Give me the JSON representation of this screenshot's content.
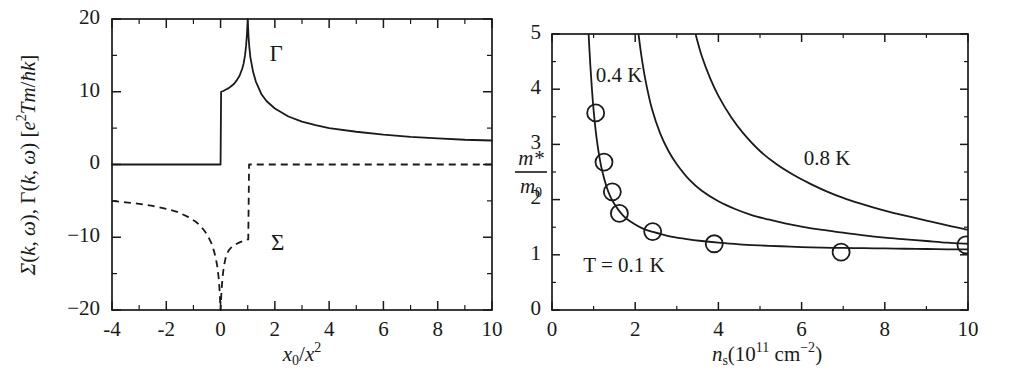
{
  "figure": {
    "panels": [
      {
        "id": "left",
        "name": "self-energy-vertex-plot",
        "xlabel": "x0/x^2",
        "xlabel_parts": {
          "base": "x",
          "sub": "0",
          "slash": "/",
          "base2": "x",
          "sup": "2"
        },
        "ylabel": "Σ(k, ω), Γ(k, ω) [e²Tm/ħk]",
        "ylabel_parts": {
          "sigma": "Σ(k, ω), ",
          "gamma": "Γ(k, ω) [",
          "e": "e",
          "e_sup": "2",
          "unit_rest": "Tm/ħk]"
        },
        "xticks": [
          -4,
          -2,
          0,
          2,
          4,
          6,
          8,
          10
        ],
        "xticklabels": [
          "-4",
          "-2",
          "0",
          "2",
          "4",
          "6",
          "8",
          "10"
        ],
        "xminor": [
          -3,
          -1,
          1,
          3,
          5,
          7,
          9
        ],
        "yticks": [
          -20,
          -10,
          0,
          10,
          20
        ],
        "yticklabels": [
          "-20",
          "-10",
          "0",
          "10",
          "20"
        ],
        "yminor": [
          -15,
          -5,
          5,
          15
        ],
        "xlim": [
          -4,
          10
        ],
        "ylim": [
          -20,
          20
        ],
        "curve_labels": [
          {
            "text": "Γ",
            "x": 2.05,
            "y": 15.0,
            "name": "gamma-curve-label"
          },
          {
            "text": "Σ",
            "x": 2.1,
            "y": -11.0,
            "name": "sigma-curve-label"
          }
        ]
      },
      {
        "id": "right",
        "name": "effective-mass-plot",
        "xlabel": "ns(10^11 cm^-2)",
        "xlabel_parts": {
          "n": "n",
          "n_sub": "s",
          "open": "(10",
          "exp": "11",
          "unit": " cm",
          "unit_exp": "–2",
          "close": ")"
        },
        "ylabel": "m*/m0",
        "ylabel_parts": {
          "num": "m*",
          "den_base": "m",
          "den_sub": "0"
        },
        "xticks": [
          0,
          2,
          4,
          6,
          8,
          10
        ],
        "xticklabels": [
          "0",
          "2",
          "4",
          "6",
          "8",
          "10"
        ],
        "xminor": [
          1,
          3,
          5,
          7,
          9
        ],
        "yticks": [
          0,
          1,
          2,
          3,
          4,
          5
        ],
        "yticklabels": [
          "0",
          "1",
          "2",
          "3",
          "4",
          "5"
        ],
        "yminor": [
          0.5,
          1.5,
          2.5,
          3.5,
          4.5
        ],
        "xlim": [
          0,
          10
        ],
        "ylim": [
          0,
          5
        ],
        "temp_labels": [
          {
            "text": "0.4 K",
            "x": 1.05,
            "y": 4.22,
            "name": "temp-label-0p4K"
          },
          {
            "text": "0.8 K",
            "x": 6.05,
            "y": 2.72,
            "name": "temp-label-0p8K"
          },
          {
            "text": "T = 0.1 K",
            "x": 0.75,
            "y": 0.78,
            "name": "temp-label-0p1K"
          }
        ]
      }
    ]
  },
  "chart_data": [
    {
      "type": "line",
      "title": "",
      "xlabel": "x_0/x^2",
      "ylabel": "Σ(k,ω), Γ(k,ω) [e^2 T m / ħ k]",
      "xlim": [
        -4,
        10
      ],
      "ylim": [
        -20,
        20
      ],
      "grid": false,
      "legend": "inline-annotations",
      "series": [
        {
          "name": "Γ(k,ω)",
          "style": "solid",
          "x": [
            -4.0,
            -3.0,
            -2.0,
            -1.0,
            -0.4,
            -0.05,
            0.0,
            0.02,
            0.1,
            0.2,
            0.3,
            0.4,
            0.5,
            0.6,
            0.7,
            0.8,
            0.85,
            0.9,
            0.94,
            0.97,
            0.99,
            1.0,
            1.01,
            1.03,
            1.06,
            1.1,
            1.2,
            1.3,
            1.5,
            1.7,
            2.0,
            2.5,
            3.0,
            3.5,
            4.0,
            5.0,
            6.0,
            7.0,
            8.0,
            9.0,
            10.0
          ],
          "y": [
            0.0,
            0.0,
            0.0,
            0.0,
            0.0,
            0.0,
            0.0,
            10.0,
            10.1,
            10.3,
            10.5,
            10.8,
            11.1,
            11.6,
            12.2,
            13.2,
            13.9,
            15.0,
            16.3,
            17.8,
            19.2,
            20.0,
            19.2,
            17.6,
            16.1,
            14.7,
            12.7,
            11.4,
            9.7,
            8.7,
            7.7,
            6.6,
            5.9,
            5.4,
            5.0,
            4.5,
            4.1,
            3.8,
            3.6,
            3.4,
            3.3
          ]
        },
        {
          "name": "Σ(k,ω)",
          "style": "dashed",
          "x": [
            -4.0,
            -3.5,
            -3.0,
            -2.5,
            -2.0,
            -1.6,
            -1.2,
            -0.9,
            -0.7,
            -0.5,
            -0.35,
            -0.25,
            -0.18,
            -0.12,
            -0.07,
            -0.03,
            -0.01,
            0.0,
            0.01,
            0.03,
            0.07,
            0.12,
            0.2,
            0.3,
            0.42,
            0.55,
            0.7,
            0.85,
            0.95,
            1.0,
            1.02,
            1.05,
            1.2,
            2.0,
            4.0,
            7.0,
            10.0
          ],
          "y": [
            -5.0,
            -5.2,
            -5.4,
            -5.7,
            -6.1,
            -6.5,
            -7.2,
            -7.9,
            -8.6,
            -9.6,
            -10.7,
            -11.8,
            -12.8,
            -14.0,
            -15.6,
            -17.6,
            -19.3,
            -20.0,
            -19.3,
            -17.6,
            -15.6,
            -14.0,
            -12.6,
            -11.8,
            -11.3,
            -11.0,
            -10.7,
            -10.5,
            -10.4,
            -10.3,
            -10.3,
            0.0,
            0.0,
            0.0,
            0.0,
            0.0,
            0.0
          ]
        }
      ],
      "annotations": [
        {
          "text": "Γ",
          "x": 2.05,
          "y": 15.0
        },
        {
          "text": "Σ",
          "x": 2.1,
          "y": -11.0
        }
      ]
    },
    {
      "type": "line",
      "title": "",
      "xlabel": "n_s (10^11 cm^-2)",
      "ylabel": "m*/m_0",
      "xlim": [
        0,
        10
      ],
      "ylim": [
        0,
        5
      ],
      "grid": false,
      "legend": "inline-annotations",
      "series": [
        {
          "name": "T = 0.1 K",
          "style": "solid",
          "x": [
            0.88,
            0.92,
            0.96,
            1.0,
            1.05,
            1.1,
            1.15,
            1.2,
            1.3,
            1.4,
            1.5,
            1.6,
            1.7,
            1.8,
            2.0,
            2.2,
            2.4,
            2.8,
            3.2,
            3.6,
            4.0,
            4.5,
            5.0,
            5.5,
            6.0,
            6.5,
            7.0,
            7.5,
            8.0,
            8.5,
            9.0,
            9.5,
            10.0
          ],
          "y": [
            5.0,
            4.45,
            4.0,
            3.62,
            3.25,
            2.96,
            2.73,
            2.54,
            2.26,
            2.06,
            1.92,
            1.81,
            1.72,
            1.65,
            1.55,
            1.47,
            1.42,
            1.34,
            1.29,
            1.25,
            1.22,
            1.19,
            1.17,
            1.155,
            1.14,
            1.13,
            1.125,
            1.12,
            1.115,
            1.11,
            1.105,
            1.1,
            1.1
          ]
        },
        {
          "name": "0.4 K",
          "style": "solid",
          "x": [
            2.08,
            2.15,
            2.25,
            2.4,
            2.6,
            2.8,
            3.0,
            3.3,
            3.6,
            4.0,
            4.4,
            4.8,
            5.2,
            5.6,
            6.0,
            6.5,
            7.0,
            7.5,
            8.0,
            8.5,
            9.0,
            9.5,
            10.0
          ],
          "y": [
            5.0,
            4.6,
            4.15,
            3.65,
            3.2,
            2.88,
            2.64,
            2.36,
            2.16,
            1.97,
            1.83,
            1.72,
            1.64,
            1.57,
            1.51,
            1.45,
            1.4,
            1.35,
            1.31,
            1.28,
            1.25,
            1.22,
            1.2
          ]
        },
        {
          "name": "0.8 K",
          "style": "solid",
          "x": [
            3.45,
            3.6,
            3.8,
            4.0,
            4.3,
            4.6,
            5.0,
            5.4,
            5.8,
            6.2,
            6.6,
            7.0,
            7.4,
            7.8,
            8.2,
            8.6,
            9.0,
            9.4,
            9.7,
            10.0
          ],
          "y": [
            5.0,
            4.6,
            4.2,
            3.88,
            3.5,
            3.2,
            2.88,
            2.64,
            2.45,
            2.29,
            2.15,
            2.03,
            1.93,
            1.84,
            1.76,
            1.69,
            1.62,
            1.55,
            1.5,
            1.45
          ]
        }
      ],
      "scatter": {
        "name": "experimental data",
        "marker": "open-circle",
        "x": [
          1.05,
          1.25,
          1.45,
          1.62,
          2.42,
          3.9,
          6.95,
          9.95
        ],
        "y": [
          3.57,
          2.68,
          2.14,
          1.75,
          1.42,
          1.2,
          1.05,
          1.18
        ]
      },
      "annotations": [
        {
          "text": "0.4 K",
          "x": 1.05,
          "y": 4.22
        },
        {
          "text": "0.8 K",
          "x": 6.05,
          "y": 2.72
        },
        {
          "text": "T = 0.1 K",
          "x": 0.75,
          "y": 0.78
        }
      ]
    }
  ]
}
